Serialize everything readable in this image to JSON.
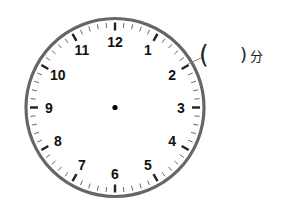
{
  "clock": {
    "numerals": [
      "12",
      "1",
      "2",
      "3",
      "4",
      "5",
      "6",
      "7",
      "8",
      "9",
      "10",
      "11"
    ],
    "colors": {
      "ring": "#666666",
      "ticks": "#222222",
      "numerals": "#111111",
      "center_dot": "#000000",
      "leader_line": "#888888"
    }
  },
  "annotation": {
    "open_paren": "(",
    "blank": "",
    "close_paren": ")",
    "unit": "分",
    "points_to": "2"
  }
}
